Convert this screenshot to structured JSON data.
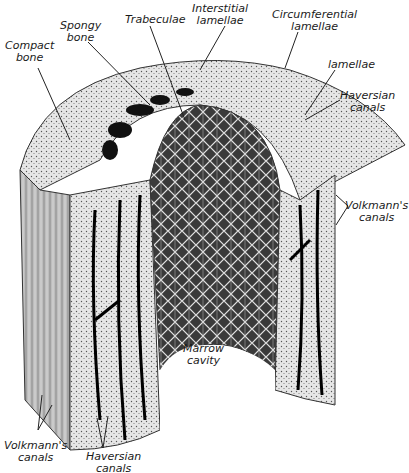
{
  "figure": {
    "labels": {
      "compact_bone": "Compact\nbone",
      "spongy_bone": "Spongy\nbone",
      "trabeculae": "Trabeculae",
      "interstitial_lamellae": "Interstitial\nlamellae",
      "circumferential_lamellae": "Circumferential\nlamellae",
      "lamellae": "lamellae",
      "haversian_canals_top": "Haversian\ncanals",
      "volkmanns_canals_right": "Volkmann's\ncanals",
      "marrow_cavity": "Marrow\ncavity",
      "volkmanns_canals_bottom": "Volkmann's\ncanals",
      "haversian_canals_bottom": "Haversian\ncanals"
    }
  }
}
